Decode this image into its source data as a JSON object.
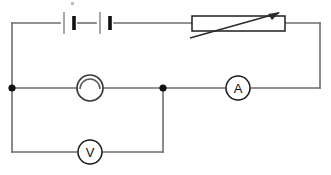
{
  "diagram": {
    "type": "circuit-schematic",
    "canvas": {
      "width": 331,
      "height": 175,
      "background": "#ffffff"
    },
    "colors": {
      "wire": "#6e6e6e",
      "component_outline": "#1a1a1a",
      "node": "#111111",
      "battery_terminal": "#111111",
      "background": "#ffffff"
    },
    "components": {
      "battery": {
        "name": "battery",
        "cell_count": 2,
        "label": "",
        "position": {
          "x": 60,
          "y": 23
        }
      },
      "rheostat": {
        "name": "rheostat",
        "label": "",
        "box": {
          "x": 192,
          "y": 16,
          "width": 93,
          "height": 15
        }
      },
      "lamp": {
        "name": "lamp",
        "label": "",
        "center": {
          "x": 90,
          "y": 88
        },
        "radius": 13
      },
      "ammeter": {
        "name": "ammeter",
        "label": "A",
        "center": {
          "x": 238,
          "y": 88
        },
        "radius": 12
      },
      "voltmeter": {
        "name": "voltmeter",
        "label": "V",
        "center": {
          "x": 90,
          "y": 152
        },
        "radius": 12
      }
    },
    "nodes": [
      {
        "name": "left-junction",
        "x": 12,
        "y": 88
      },
      {
        "name": "middle-junction",
        "x": 163,
        "y": 88
      }
    ],
    "branches": [
      {
        "name": "top-branch-source",
        "contains": [
          "battery",
          "rheostat"
        ]
      },
      {
        "name": "middle-branch-load",
        "contains": [
          "lamp",
          "ammeter"
        ]
      },
      {
        "name": "bottom-branch-measure",
        "contains": [
          "voltmeter"
        ]
      }
    ]
  }
}
